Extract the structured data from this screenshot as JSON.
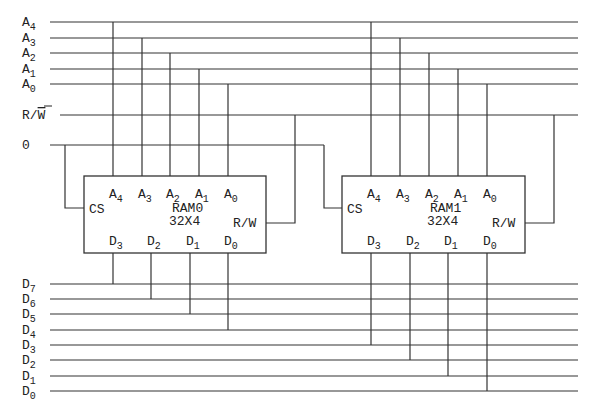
{
  "address_bus": [
    {
      "name": "A",
      "sub": "4",
      "y": 22
    },
    {
      "name": "A",
      "sub": "3",
      "y": 38
    },
    {
      "name": "A",
      "sub": "2",
      "y": 53
    },
    {
      "name": "A",
      "sub": "1",
      "y": 69
    },
    {
      "name": "A",
      "sub": "0",
      "y": 84
    }
  ],
  "control": {
    "rw_label": "R/",
    "rw_bar_label": "W",
    "rw_y": 115,
    "zero_label": "0",
    "zero_y": 145
  },
  "data_bus": [
    {
      "name": "D",
      "sub": "7",
      "y": 284
    },
    {
      "name": "D",
      "sub": "6",
      "y": 299
    },
    {
      "name": "D",
      "sub": "5",
      "y": 314
    },
    {
      "name": "D",
      "sub": "4",
      "y": 330
    },
    {
      "name": "D",
      "sub": "3",
      "y": 345
    },
    {
      "name": "D",
      "sub": "2",
      "y": 360
    },
    {
      "name": "D",
      "sub": "1",
      "y": 376
    },
    {
      "name": "D",
      "sub": "0",
      "y": 391
    }
  ],
  "chips": [
    {
      "name": "RAM0",
      "size": "32X4",
      "cs_label": "CS",
      "rw_label": "R/W",
      "box": {
        "x": 84,
        "y": 176,
        "w": 182,
        "h": 77
      },
      "addr_pins": [
        {
          "label": "A",
          "sub": "4",
          "x": 113
        },
        {
          "label": "A",
          "sub": "3",
          "x": 142
        },
        {
          "label": "A",
          "sub": "2",
          "x": 170
        },
        {
          "label": "A",
          "sub": "1",
          "x": 199
        },
        {
          "label": "A",
          "sub": "0",
          "x": 228
        }
      ],
      "data_pins": [
        {
          "label": "D",
          "sub": "3",
          "x": 113,
          "bus_y": 284
        },
        {
          "label": "D",
          "sub": "2",
          "x": 151,
          "bus_y": 299
        },
        {
          "label": "D",
          "sub": "1",
          "x": 190,
          "bus_y": 314
        },
        {
          "label": "D",
          "sub": "0",
          "x": 228,
          "bus_y": 330
        }
      ],
      "cs_x": 65,
      "rw_x": 295
    },
    {
      "name": "RAM1",
      "size": "32X4",
      "cs_label": "CS",
      "rw_label": "R/W",
      "box": {
        "x": 342,
        "y": 176,
        "w": 183,
        "h": 77
      },
      "addr_pins": [
        {
          "label": "A",
          "sub": "4",
          "x": 371
        },
        {
          "label": "A",
          "sub": "3",
          "x": 400
        },
        {
          "label": "A",
          "sub": "2",
          "x": 429
        },
        {
          "label": "A",
          "sub": "1",
          "x": 458
        },
        {
          "label": "A",
          "sub": "0",
          "x": 487
        }
      ],
      "data_pins": [
        {
          "label": "D",
          "sub": "3",
          "x": 371,
          "bus_y": 345
        },
        {
          "label": "D",
          "sub": "2",
          "x": 410,
          "bus_y": 360
        },
        {
          "label": "D",
          "sub": "1",
          "x": 448,
          "bus_y": 376
        },
        {
          "label": "D",
          "sub": "0",
          "x": 487,
          "bus_y": 391
        }
      ],
      "cs_x": 324,
      "rw_x": 554
    }
  ]
}
